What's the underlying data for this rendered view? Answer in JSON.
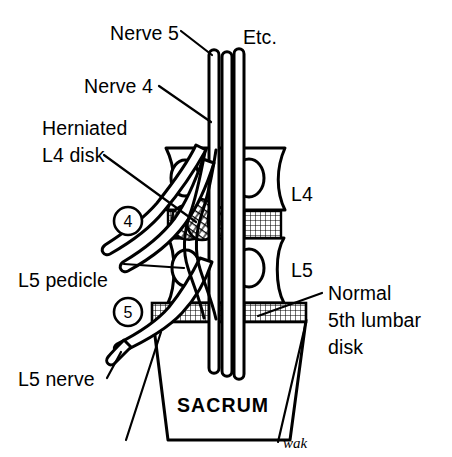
{
  "figure": {
    "background_color": "#ffffff",
    "ink_color": "#000000",
    "signature": "wak"
  },
  "labels": {
    "nerve5": "Nerve 5",
    "etc": "Etc.",
    "nerve4": "Nerve 4",
    "herniated_line1": "Herniated",
    "herniated_line2": "L4 disk",
    "l4": "L4",
    "l5": "L5",
    "l5_pedicle": "L5 pedicle",
    "l5_nerve": "L5 nerve",
    "normal_line1": "Normal",
    "normal_line2": "5th lumbar",
    "normal_line3": "disk",
    "sacrum": "SACRUM",
    "marker4": "4",
    "marker5": "5"
  },
  "anatomy": {
    "vertebrae": [
      "L4",
      "L5"
    ],
    "disks": [
      {
        "name": "Herniated L4 disk",
        "state": "herniated",
        "pattern": "crosshatch"
      },
      {
        "name": "Normal 5th lumbar disk",
        "state": "normal",
        "pattern": "crosshatch"
      }
    ],
    "nerve_roots": [
      {
        "name": "Nerve 4",
        "marker": "4"
      },
      {
        "name": "Nerve 5",
        "marker": "5"
      }
    ],
    "structures": [
      "L5 pedicle",
      "SACRUM",
      "cauda equina bundle"
    ]
  }
}
